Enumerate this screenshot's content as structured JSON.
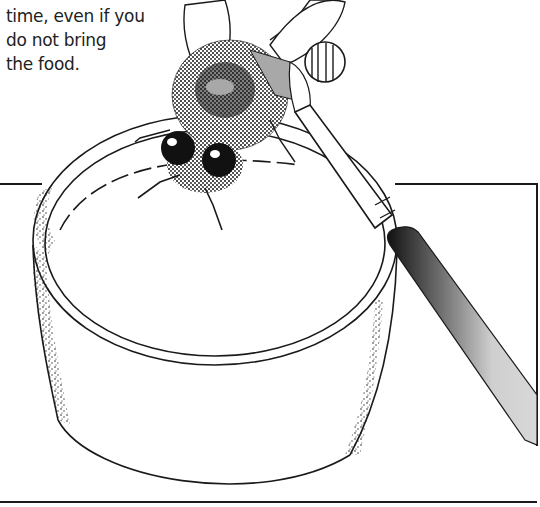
{
  "caption": {
    "lines": [
      "time, even if you",
      "do not bring",
      "the food."
    ]
  },
  "illustration": {
    "subject": "bee-on-jar-lid-with-paintbrush",
    "elements": [
      "bee",
      "paintbrush",
      "jar",
      "frame"
    ],
    "colors": {
      "ink": "#1a1a1a",
      "paper": "#ffffff",
      "paint_mark": "#a8a8a8",
      "brush_handle": "#c8c8c8"
    }
  }
}
